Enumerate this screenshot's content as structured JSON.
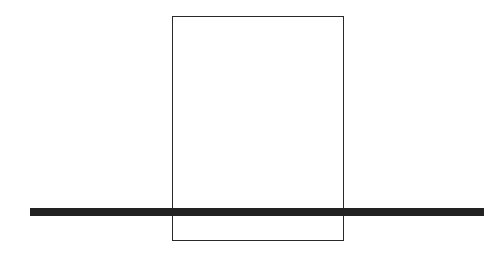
{
  "diagram": {
    "shapes": [
      {
        "type": "rectangle",
        "x": 172,
        "y": 16,
        "width": 172,
        "height": 225,
        "stroke": "#2a2a2a",
        "fill": "none"
      },
      {
        "type": "bar",
        "x": 30,
        "y": 208,
        "width": 454,
        "height": 8,
        "fill": "#222222"
      }
    ]
  }
}
